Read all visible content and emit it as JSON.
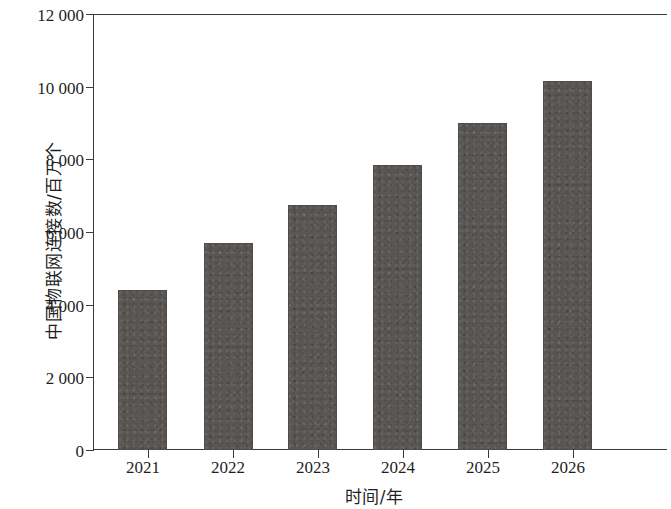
{
  "chart_data": {
    "type": "bar",
    "title": "",
    "subtitle": "",
    "xlabel": "时间/年",
    "ylabel": "中国物联网连接数/百万个",
    "categories": [
      "2021",
      "2022",
      "2023",
      "2024",
      "2025",
      "2026"
    ],
    "values": [
      4400,
      5700,
      6750,
      7850,
      9000,
      10150
    ],
    "series": [
      {
        "name": "中国物联网连接数",
        "values": [
          4400,
          5700,
          6750,
          7850,
          9000,
          10150
        ]
      }
    ],
    "ylim": [
      0,
      12000
    ],
    "ytick_values": [
      0,
      2000,
      4000,
      6000,
      8000,
      10000,
      12000
    ],
    "ytick_labels": [
      "0",
      "2 000",
      "4 000",
      "6 000",
      "8 000",
      "10 000",
      "12 000"
    ],
    "xtick_labels": [
      "2021",
      "2022",
      "2023",
      "2024",
      "2025",
      "2026"
    ],
    "grid": false,
    "legend": false,
    "legend_position": "none",
    "bar_color": "#595653",
    "axis_color": "#3a3a3a",
    "text_color": "#1f1f1f",
    "background_color": "#ffffff"
  }
}
